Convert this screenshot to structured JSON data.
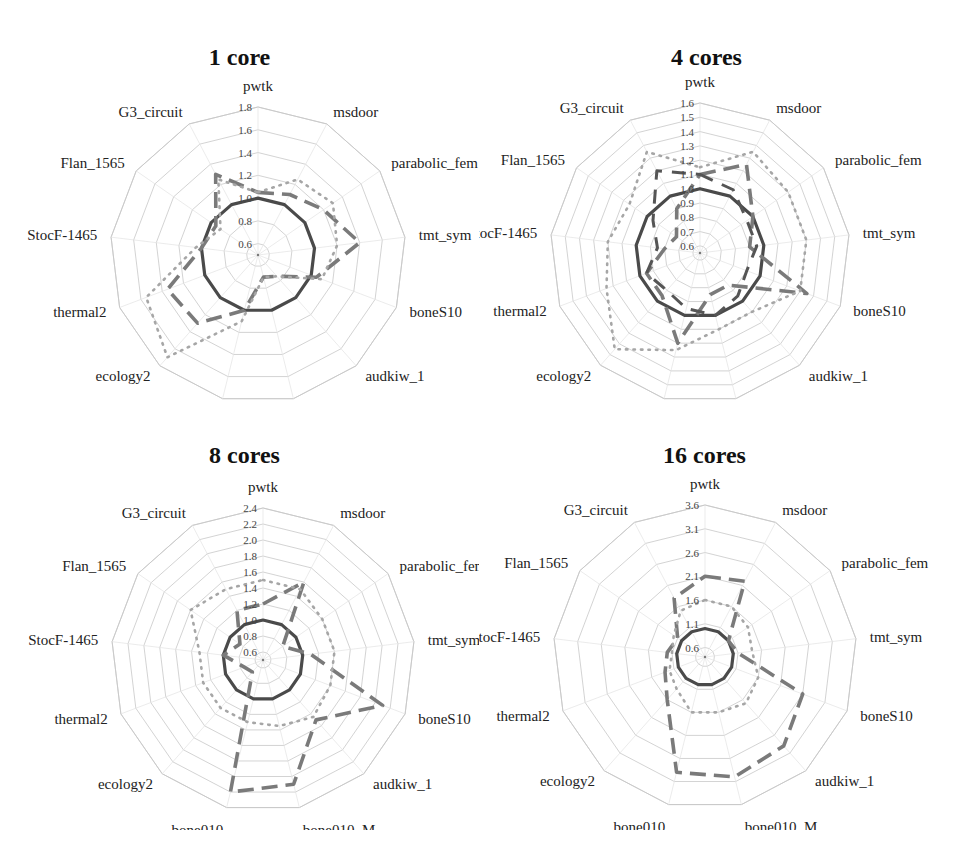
{
  "figure": {
    "axes_labels": [
      "pwtk",
      "msdoor",
      "parabolic_fem",
      "tmt_sym",
      "boneS10",
      "audkiw_1",
      "bone010_M",
      "bone010",
      "ecology2",
      "thermal2",
      "StocF-1465",
      "Flan_1565",
      "G3_circuit"
    ]
  },
  "chart_data": [
    {
      "type": "radar",
      "title": "1 core",
      "categories": [
        "pwtk",
        "msdoor",
        "parabolic_fem",
        "tmt_sym",
        "boneS10",
        "audkiw_1",
        "bone010_M",
        "bone010",
        "ecology2",
        "thermal2",
        "StocF-1465",
        "Flan_1565",
        "G3_circuit"
      ],
      "rlim": [
        0.5,
        1.8
      ],
      "ticks": [
        "0.6",
        "0.8",
        "1.0",
        "1.2",
        "1.4",
        "1.6",
        "1.8"
      ],
      "tick_values": [
        0.6,
        0.8,
        1.0,
        1.2,
        1.4,
        1.6,
        1.8
      ],
      "series": [
        {
          "name": "baseline",
          "style": "solid",
          "values": [
            1.0,
            1.0,
            1.0,
            1.0,
            1.0,
            1.0,
            1.0,
            1.0,
            1.0,
            1.0,
            1.0,
            1.0,
            1.0
          ]
        },
        {
          "name": "series-dashed",
          "style": "dashed",
          "values": [
            1.05,
            1.1,
            1.2,
            1.4,
            1.05,
            0.75,
            0.7,
            1.0,
            1.3,
            1.35,
            1.0,
            0.95,
            1.3
          ]
        },
        {
          "name": "series-dotted",
          "style": "dotted",
          "values": [
            1.05,
            1.25,
            1.3,
            1.2,
            1.1,
            0.75,
            0.7,
            1.1,
            1.7,
            1.55,
            1.05,
            0.9,
            1.25
          ]
        }
      ]
    },
    {
      "type": "radar",
      "title": "4 cores",
      "categories": [
        "pwtk",
        "msdoor",
        "parabolic_fem",
        "tmt_sym",
        "boneS10",
        "audkiw_1",
        "bone010_M",
        "bone010",
        "ecology2",
        "thermal2",
        "StocF-1465",
        "Flan_1565",
        "G3_circuit"
      ],
      "rlim": [
        0.55,
        1.6
      ],
      "ticks": [
        "0.6",
        "0.7",
        "0.8",
        "0.9",
        "1.0",
        "1.1",
        "1.2",
        "1.3",
        "1.4",
        "1.5",
        "1.6"
      ],
      "tick_values": [
        0.6,
        0.7,
        0.8,
        0.9,
        1.0,
        1.1,
        1.2,
        1.3,
        1.4,
        1.5,
        1.6
      ],
      "series": [
        {
          "name": "baseline",
          "style": "solid",
          "values": [
            1.0,
            1.0,
            1.0,
            1.0,
            1.0,
            1.0,
            1.0,
            1.0,
            1.0,
            1.0,
            1.0,
            1.0,
            1.0
          ]
        },
        {
          "name": "series-dashed",
          "style": "dashed",
          "values": [
            1.1,
            1.25,
            1.0,
            0.9,
            1.35,
            0.85,
            0.85,
            1.2,
            0.95,
            0.95,
            0.8,
            0.75,
            0.9
          ]
        },
        {
          "name": "series-dotted",
          "style": "dotted",
          "values": [
            1.15,
            1.35,
            1.3,
            1.3,
            1.3,
            1.1,
            1.1,
            1.25,
            1.45,
            1.25,
            1.2,
            1.15,
            1.35
          ]
        },
        {
          "name": "series-dark-dashed",
          "style": "dashed-dark",
          "values": [
            1.1,
            1.05,
            0.95,
            0.95,
            0.9,
            0.95,
            1.0,
            0.95,
            0.9,
            0.95,
            0.85,
            0.95,
            1.2
          ]
        }
      ]
    },
    {
      "type": "radar",
      "title": "8 cores",
      "categories": [
        "pwtk",
        "msdoor",
        "parabolic_fem",
        "tmt_sym",
        "boneS10",
        "audkiw_1",
        "bone010_M",
        "bone010",
        "ecology2",
        "thermal2",
        "StocF-1465",
        "Flan_1565",
        "G3_circuit"
      ],
      "rlim": [
        0.5,
        2.4
      ],
      "ticks": [
        "0.6",
        "0.8",
        "1.0",
        "1.2",
        "1.4",
        "1.6",
        "1.8",
        "2.0",
        "2.2",
        "2.4"
      ],
      "tick_values": [
        0.6,
        0.8,
        1.0,
        1.2,
        1.4,
        1.6,
        1.8,
        2.0,
        2.2,
        2.4
      ],
      "series": [
        {
          "name": "baseline",
          "style": "solid",
          "values": [
            1.0,
            1.0,
            1.0,
            1.0,
            1.0,
            1.0,
            1.0,
            1.0,
            1.0,
            1.0,
            1.0,
            1.0,
            1.0
          ]
        },
        {
          "name": "series-dashed",
          "style": "dashed",
          "values": [
            1.2,
            1.6,
            0.8,
            1.1,
            2.1,
            1.5,
            2.1,
            2.2,
            0.7,
            0.75,
            1.0,
            0.85,
            1.2
          ]
        },
        {
          "name": "series-dotted",
          "style": "dotted",
          "values": [
            1.5,
            1.5,
            1.4,
            1.4,
            1.4,
            1.45,
            1.35,
            1.3,
            1.3,
            1.3,
            1.3,
            1.6,
            1.5
          ]
        }
      ]
    },
    {
      "type": "radar",
      "title": "16 cores",
      "categories": [
        "pwtk",
        "msdoor",
        "parabolic_fem",
        "tmt_sym",
        "boneS10",
        "audkiw_1",
        "bone010_M",
        "bone010",
        "ecology2",
        "thermal2",
        "StocF-1465",
        "Flan_1565",
        "G3_circuit"
      ],
      "rlim": [
        0.4,
        3.6
      ],
      "ticks": [
        "0.6",
        "1.1",
        "1.6",
        "2.1",
        "2.6",
        "3.1",
        "3.6"
      ],
      "tick_values": [
        0.6,
        1.1,
        1.6,
        2.1,
        2.6,
        3.1,
        3.6
      ],
      "series": [
        {
          "name": "baseline",
          "style": "solid",
          "values": [
            1.0,
            1.0,
            1.0,
            1.0,
            1.0,
            1.0,
            1.0,
            1.0,
            1.0,
            1.0,
            1.0,
            1.0,
            1.0
          ]
        },
        {
          "name": "series-dashed",
          "style": "dashed",
          "values": [
            2.1,
            2.2,
            1.0,
            1.1,
            2.6,
            2.9,
            3.0,
            2.9,
            1.6,
            1.3,
            1.2,
            1.1,
            1.8
          ]
        },
        {
          "name": "series-dotted",
          "style": "dotted",
          "values": [
            1.6,
            1.6,
            1.5,
            1.4,
            1.6,
            1.7,
            1.6,
            1.6,
            1.3,
            1.2,
            1.1,
            1.2,
            1.5
          ]
        }
      ]
    }
  ],
  "colors": {
    "grid": "#c8c8c8",
    "spoke": "#e2e2e2",
    "solid": "#4a4a4a",
    "dashed": "#7a7a7a",
    "dotted": "#a6a6a6",
    "dark_dashed": "#555555",
    "text": "#222222",
    "title": "#111111"
  }
}
